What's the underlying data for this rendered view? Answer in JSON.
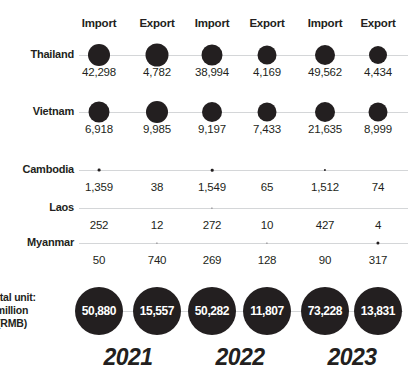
{
  "chart_data": {
    "type": "bar",
    "title": "",
    "subtitle": "",
    "xlabel": "",
    "ylabel": "",
    "legend_position": "top",
    "grid": false,
    "unit_note": [
      "Total unit:",
      "million",
      "(RMB)"
    ],
    "years": [
      "2021",
      "2022",
      "2023"
    ],
    "column_headers": [
      "Import",
      "Export",
      "Import",
      "Export",
      "Import",
      "Export"
    ],
    "categories": [
      "Thailand",
      "Vietnam",
      "Cambodia",
      "Laos",
      "Myanmar"
    ],
    "series": [
      {
        "name": "2021 Import",
        "values": [
          42298,
          6918,
          1359,
          252,
          50
        ]
      },
      {
        "name": "2021 Export",
        "values": [
          4782,
          9985,
          38,
          12,
          740
        ]
      },
      {
        "name": "2022 Import",
        "values": [
          38994,
          9197,
          1549,
          272,
          269
        ]
      },
      {
        "name": "2022 Export",
        "values": [
          4169,
          7433,
          65,
          10,
          128
        ]
      },
      {
        "name": "2023 Import",
        "values": [
          49562,
          21635,
          1512,
          427,
          90
        ]
      },
      {
        "name": "2023 Export",
        "values": [
          4434,
          8999,
          74,
          4,
          317
        ]
      }
    ],
    "totals": {
      "labels": [
        "50,880",
        "15,557",
        "50,282",
        "11,807",
        "73,228",
        "13,831"
      ],
      "values": [
        50880,
        15557,
        50282,
        11807,
        73228,
        13831
      ]
    }
  },
  "columns": [
    {
      "header": "Import",
      "cx": 99
    },
    {
      "header": "Export",
      "cx": 157
    },
    {
      "header": "Import",
      "cx": 212
    },
    {
      "header": "Export",
      "cx": 267
    },
    {
      "header": "Import",
      "cx": 325
    },
    {
      "header": "Export",
      "cx": 378
    }
  ],
  "rows": [
    {
      "label": "Thailand",
      "y": 55,
      "cells": [
        {
          "value": "42,298",
          "r": 11.0
        },
        {
          "value": "4,782",
          "r": 11.5
        },
        {
          "value": "38,994",
          "r": 10.5
        },
        {
          "value": "4,169",
          "r": 9.5
        },
        {
          "value": "49,562",
          "r": 10.0
        },
        {
          "value": "4,434",
          "r": 9.0
        }
      ]
    },
    {
      "label": "Vietnam",
      "y": 112,
      "cells": [
        {
          "value": "6,918",
          "r": 10.5
        },
        {
          "value": "9,985",
          "r": 11.0
        },
        {
          "value": "9,197",
          "r": 10.0
        },
        {
          "value": "7,433",
          "r": 9.5
        },
        {
          "value": "21,635",
          "r": 10.0
        },
        {
          "value": "8,999",
          "r": 9.5
        }
      ]
    },
    {
      "label": "Cambodia",
      "y": 170,
      "cells": [
        {
          "value": "1,359",
          "r": 1.4
        },
        {
          "value": "38",
          "r": 0.0
        },
        {
          "value": "1,549",
          "r": 1.3
        },
        {
          "value": "65",
          "r": 0.0
        },
        {
          "value": "1,512",
          "r": 1.1
        },
        {
          "value": "74",
          "r": 0.0
        }
      ]
    },
    {
      "label": "Laos",
      "y": 208,
      "cells": [
        {
          "value": "252",
          "r": 0.0
        },
        {
          "value": "12",
          "r": 0.0
        },
        {
          "value": "272",
          "r": 0.6
        },
        {
          "value": "10",
          "r": 0.0
        },
        {
          "value": "427",
          "r": 0.0
        },
        {
          "value": "4",
          "r": 0.0
        }
      ]
    },
    {
      "label": "Myanmar",
      "y": 243,
      "cells": [
        {
          "value": "50",
          "r": 0.0
        },
        {
          "value": "740",
          "r": 0.6
        },
        {
          "value": "269",
          "r": 0.0
        },
        {
          "value": "128",
          "r": 0.6
        },
        {
          "value": "90",
          "r": 0.0
        },
        {
          "value": "317",
          "r": 1.6
        }
      ]
    }
  ],
  "totals_row": {
    "note_line1": "Total unit:",
    "note_line2": "million",
    "note_line3": "(RMB)",
    "bubbles": [
      {
        "label": "50,880",
        "cx": 99
      },
      {
        "label": "15,557",
        "cx": 157
      },
      {
        "label": "50,282",
        "cx": 212
      },
      {
        "label": "11,807",
        "cx": 267
      },
      {
        "label": "73,228",
        "cx": 325
      },
      {
        "label": "13,831",
        "cx": 378
      }
    ]
  },
  "years": [
    {
      "label": "2021",
      "cx": 128
    },
    {
      "label": "2022",
      "cx": 240
    },
    {
      "label": "2023",
      "cx": 352
    }
  ],
  "colors": {
    "bubble": "#231f20",
    "axis": "#d4d6d8",
    "text": "#231f20",
    "bubble_text": "#ffffff",
    "background": "#ffffff"
  }
}
